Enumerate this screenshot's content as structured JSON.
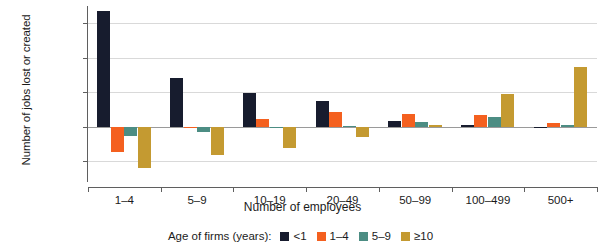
{
  "chart_data": {
    "type": "bar",
    "title": "",
    "subtitle": "",
    "xlabel": "Number of employees",
    "ylabel": "Number of jobs lost or created",
    "categories": [
      "1–4",
      "5–9",
      "10–19",
      "20–49",
      "50–99",
      "100–499",
      "500+"
    ],
    "legend_title": "Age of firms (years):",
    "legend_position": "bottom-center",
    "grid": true,
    "ylim": [
      -400000,
      875000
    ],
    "yticks": [
      -250000,
      0,
      250000,
      500000,
      750000
    ],
    "ytick_labels": [
      "−250,000",
      "0",
      "250,000",
      "500,000",
      "750,000"
    ],
    "series": [
      {
        "name": "<1",
        "color": "#171c2e",
        "values": [
          840000,
          350000,
          245000,
          190000,
          45000,
          15000,
          2000
        ]
      },
      {
        "name": "1–4",
        "color": "#f4601f",
        "values": [
          -180000,
          -10000,
          55000,
          110000,
          90000,
          85000,
          25000
        ]
      },
      {
        "name": "5–9",
        "color": "#4c8d83",
        "values": [
          -65000,
          -40000,
          -2000,
          8000,
          35000,
          70000,
          10000
        ]
      },
      {
        "name": "≥10",
        "color": "#c49a31",
        "values": [
          -295000,
          -205000,
          -155000,
          -75000,
          12000,
          235000,
          435000
        ]
      }
    ]
  },
  "axes": {
    "y_axis_label": "Number of jobs lost or created",
    "x_axis_label": "Number of employees"
  },
  "legend": {
    "title": "Age of firms (years):",
    "items": [
      {
        "label": "<1",
        "color": "#171c2e"
      },
      {
        "label": "1–4",
        "color": "#f4601f"
      },
      {
        "label": "5–9",
        "color": "#4c8d83"
      },
      {
        "label": "≥10",
        "color": "#c49a31"
      }
    ]
  }
}
